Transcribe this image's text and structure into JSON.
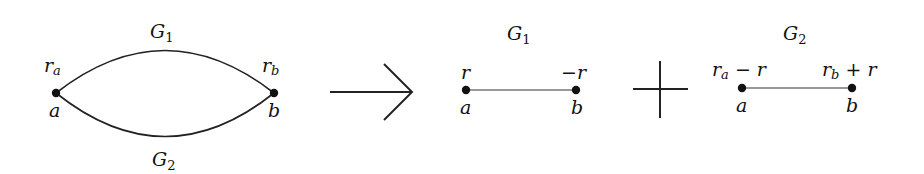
{
  "diagram": {
    "type": "graph-decomposition",
    "left_graph": {
      "upper_edge_label": "G",
      "upper_edge_label_sub": "1",
      "lower_edge_label": "G",
      "lower_edge_label_sub": "2",
      "node_a": {
        "name": "a",
        "value_base": "r",
        "value_sub": "a"
      },
      "node_b": {
        "name": "b",
        "value_base": "r",
        "value_sub": "b"
      }
    },
    "operator_arrow": "→",
    "middle_graph": {
      "edge_label": "G",
      "edge_label_sub": "1",
      "node_a": {
        "name": "a",
        "value": "r"
      },
      "node_b": {
        "name": "b",
        "value": "−r"
      }
    },
    "operator_plus": "+",
    "right_graph": {
      "edge_label": "G",
      "edge_label_sub": "2",
      "node_a": {
        "name": "a",
        "value_base": "r",
        "value_sub": "a",
        "value_suffix": " − r"
      },
      "node_b": {
        "name": "b",
        "value_base": "r",
        "value_sub": "b",
        "value_suffix": " + r"
      }
    },
    "colors": {
      "ink": "#111111",
      "background": "#ffffff"
    }
  }
}
